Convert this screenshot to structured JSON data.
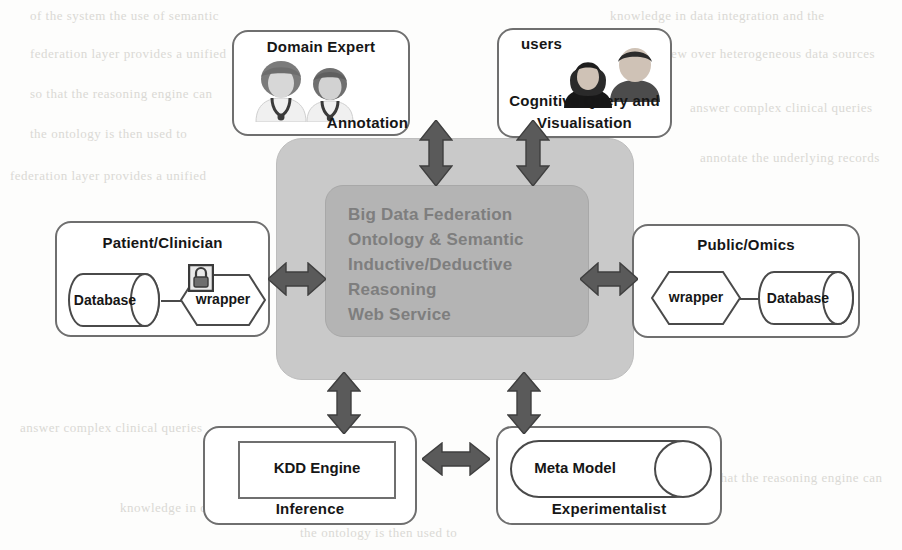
{
  "diagram": {
    "background_color": "#fdfdfc",
    "panel_color": "#c9c9c9",
    "core_color": "#b4b4b4",
    "core_text_color": "#7e7e7e",
    "arrow_color": "#5a5a5a",
    "stroke_color": "#6f6f6f"
  },
  "center": {
    "core_lines": [
      "Big Data Federation",
      "Ontology & Semantic",
      "Inductive/Deductive",
      "Reasoning",
      "Web Service"
    ],
    "core_text": "Big Data Federation\nOntology & Semantic\nInductive/Deductive\nReasoning\nWeb Service"
  },
  "nodes": {
    "domain_expert": {
      "title": "Domain Expert",
      "caption": "Annotation",
      "icons": [
        "person-doctor-icon",
        "person-doctor-icon"
      ]
    },
    "cognitive_users": {
      "title": "users",
      "caption_line1": "Cognitive Query and",
      "caption_line2": "Visualisation",
      "icons": [
        "person-user-female-icon",
        "person-user-male-icon"
      ]
    },
    "patient_clinician": {
      "title": "Patient/Clinician",
      "database_label": "Database",
      "wrapper_label": "wrapper",
      "wrapper_icon": "padlock-icon"
    },
    "public_omics": {
      "title": "Public/Omics",
      "wrapper_label": "wrapper",
      "database_label": "Database"
    },
    "kdd": {
      "engine_label": "KDD  Engine",
      "caption": "Inference"
    },
    "experimentalist": {
      "meta_model_label": "Meta Model",
      "caption": "Experimentalist"
    }
  },
  "arrows": [
    {
      "name": "arrow-center-domain-expert",
      "orientation": "vertical"
    },
    {
      "name": "arrow-center-cognitive-users",
      "orientation": "vertical"
    },
    {
      "name": "arrow-center-patient-clinician",
      "orientation": "horizontal"
    },
    {
      "name": "arrow-center-public-omics",
      "orientation": "horizontal"
    },
    {
      "name": "arrow-center-kdd",
      "orientation": "vertical"
    },
    {
      "name": "arrow-center-experimentalist",
      "orientation": "vertical"
    },
    {
      "name": "arrow-kdd-experimentalist",
      "orientation": "horizontal"
    }
  ],
  "background_bleed": [
    "of the system the use of semantic",
    "knowledge in data integration and the",
    "federation layer provides a unified",
    "view over heterogeneous data sources",
    "so that the reasoning engine can",
    "answer complex clinical queries",
    "the ontology is then used to",
    "annotate the underlying records"
  ]
}
